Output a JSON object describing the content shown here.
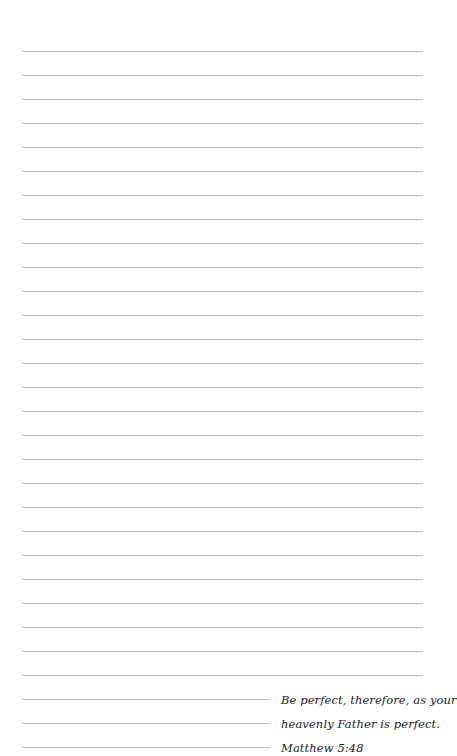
{
  "page": {
    "type": "lined-notepad",
    "line_color": "#b8b8b8",
    "first_line_y": 51,
    "line_spacing": 24,
    "full_line_count": 27,
    "short_line_count": 3,
    "line_left": 22,
    "full_line_right": 423,
    "short_line_right": 270
  },
  "quote": {
    "line1": "Be perfect, therefore, as your",
    "line2": "heavenly Father is perfect.",
    "citation": "Matthew 5:48"
  }
}
